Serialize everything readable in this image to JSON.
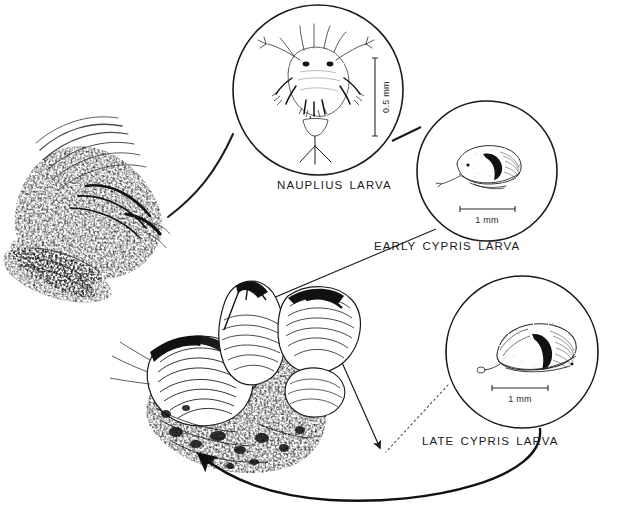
{
  "figure": {
    "type": "life-cycle-diagram",
    "background_color": "#ffffff",
    "ink_color": "#1a1a1a",
    "width": 623,
    "height": 515
  },
  "stages": [
    {
      "id": "adult-barnacle-feeding",
      "label": "",
      "caption": null,
      "illustration": "adult-barnacle-with-cirri-stipple-drawing",
      "has_circle_frame": false,
      "scale_bar": null,
      "center": {
        "x": 85,
        "y": 200
      }
    },
    {
      "id": "nauplius-larva",
      "label": "NAUPLIUS LARVA",
      "illustration": "nauplius-larva-dorsal-view",
      "has_circle_frame": true,
      "circle": {
        "cx": 318,
        "cy": 90,
        "r": 85
      },
      "scale_bar": {
        "text": "0.5 mm",
        "orientation": "vertical",
        "value": 0.5,
        "unit": "mm"
      },
      "label_position": {
        "x": 277,
        "y": 179
      }
    },
    {
      "id": "early-cypris-larva",
      "label": "EARLY CYPRIS LARVA",
      "illustration": "early-cypris-larva-lateral-view",
      "has_circle_frame": true,
      "circle": {
        "cx": 487,
        "cy": 171,
        "r": 70
      },
      "scale_bar": {
        "text": "1 mm",
        "orientation": "horizontal",
        "value": 1,
        "unit": "mm"
      },
      "label_position": {
        "x": 374,
        "y": 240
      }
    },
    {
      "id": "late-cypris-larva",
      "label": "LATE CYPRIS LARVA",
      "illustration": "late-cypris-larva-settled-lateral-view",
      "has_circle_frame": true,
      "circle": {
        "cx": 522,
        "cy": 352,
        "r": 76
      },
      "scale_bar": {
        "text": "1 mm",
        "orientation": "horizontal",
        "value": 1,
        "unit": "mm"
      },
      "label_position": {
        "x": 422,
        "y": 435
      }
    },
    {
      "id": "adult-barnacle-cluster",
      "label": "",
      "illustration": "cluster-of-adult-barnacles-on-rock",
      "has_circle_frame": false,
      "scale_bar": null,
      "center": {
        "x": 250,
        "y": 370
      }
    }
  ],
  "connectors": [
    {
      "id": "adult-to-nauplius",
      "from": "adult-barnacle-feeding",
      "to": "nauplius-larva",
      "style": "curved-line",
      "arrowhead": false
    },
    {
      "id": "nauplius-to-early-cypris",
      "from": "nauplius-larva",
      "to": "early-cypris-larva",
      "style": "short-straight-line",
      "arrowhead": false
    },
    {
      "id": "early-cypris-to-cluster",
      "from": "early-cypris-larva",
      "to": "adult-barnacle-cluster",
      "style": "straight-line",
      "arrowhead": false
    },
    {
      "id": "cluster-zigzag-to-late-cypris",
      "from": "adult-barnacle-cluster",
      "to": "late-cypris-larva",
      "style": "zigzag-line-with-arrowhead",
      "arrowhead": true
    },
    {
      "id": "late-cypris-dotted-leader",
      "from": "late-cypris-larva",
      "to": "zigzag-arrow-tip",
      "style": "dotted-line",
      "arrowhead": false
    },
    {
      "id": "late-cypris-to-cluster-settle",
      "from": "late-cypris-larva",
      "to": "adult-barnacle-cluster",
      "style": "thick-curved-arrow",
      "arrowhead": true
    }
  ],
  "scale_bars": {
    "nauplius": "0.5 mm",
    "early_cypris": "1 mm",
    "late_cypris": "1 mm"
  }
}
